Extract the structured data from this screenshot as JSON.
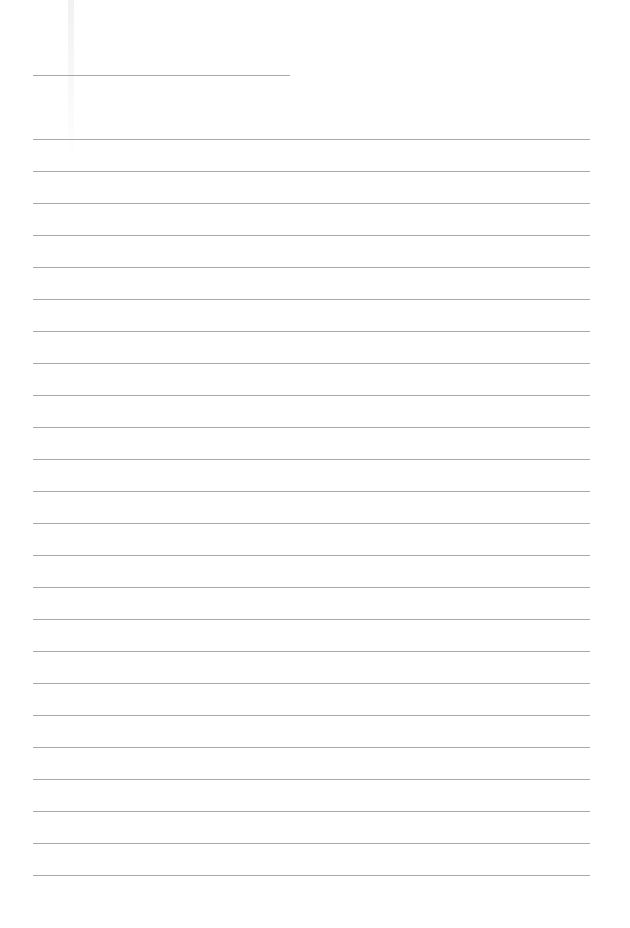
{
  "page": {
    "type": "blank-lined-paper",
    "background_color": "#ffffff",
    "line_color": "#aaaaaa"
  },
  "header_line": {
    "x": 33,
    "y": 75,
    "width": 257
  },
  "ruled_lines": {
    "count": 24,
    "first_y": 139,
    "spacing": 32,
    "x": 33,
    "width": 557
  }
}
